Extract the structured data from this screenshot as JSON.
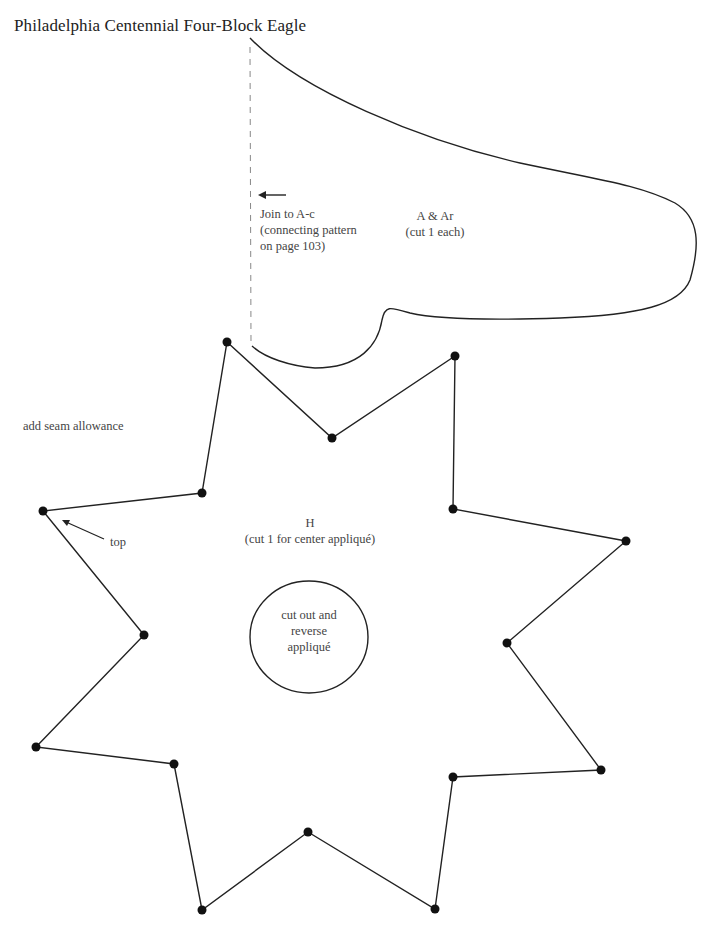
{
  "title": "Philadelphia Centennial Four-Block Eagle",
  "piece_a": {
    "label": "A & Ar",
    "instruction": "(cut 1 each)",
    "join_note": {
      "line1": "Join to A-c",
      "line2": "(connecting pattern",
      "line3": "on page 103)"
    }
  },
  "piece_h": {
    "label": "H",
    "instruction": "(cut 1 for center appliqué)",
    "circle_note": {
      "line1": "cut out and",
      "line2": "reverse",
      "line3": "appliqué"
    },
    "vertices": [
      [
        227,
        342
      ],
      [
        332,
        438
      ],
      [
        455,
        356
      ],
      [
        453,
        509
      ],
      [
        626,
        541
      ],
      [
        507,
        643
      ],
      [
        601,
        770
      ],
      [
        453,
        777
      ],
      [
        435,
        909
      ],
      [
        308,
        832
      ],
      [
        202,
        910
      ],
      [
        174,
        764
      ],
      [
        36,
        747
      ],
      [
        144,
        635
      ],
      [
        43,
        511
      ],
      [
        202,
        493
      ]
    ]
  },
  "seam_note": "add seam allowance",
  "top_note": "top",
  "colors": {
    "line": "#222222",
    "dashed": "#888888",
    "text": "#444444"
  }
}
